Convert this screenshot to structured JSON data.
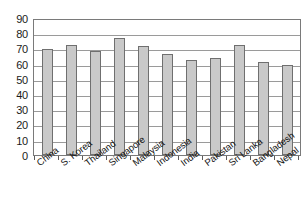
{
  "chart_data": {
    "type": "bar",
    "title": "",
    "subtitle": "",
    "xlabel": "",
    "ylabel": "",
    "categories": [
      "China",
      "S. Korea",
      "Thailand",
      "Singapore",
      "Malaysia",
      "Indonesia",
      "India",
      "Pakistan",
      "Sri Lanka",
      "Bangladesh",
      "Nepal"
    ],
    "values": [
      71,
      73.5,
      69.5,
      78,
      73,
      67.5,
      63.5,
      64.5,
      73.5,
      62,
      60
    ],
    "series": [
      {
        "name": "",
        "values": [
          71,
          73.5,
          69.5,
          78,
          73,
          67.5,
          63.5,
          64.5,
          73.5,
          62,
          60
        ]
      }
    ],
    "ylim": [
      0,
      90
    ],
    "ytick_step": 10,
    "ytick_labels": [
      "90",
      "80",
      "70",
      "60",
      "50",
      "40",
      "30",
      "20",
      "10",
      "0"
    ],
    "ytick_values": [
      90,
      80,
      70,
      60,
      50,
      40,
      30,
      20,
      10,
      0
    ],
    "grid": true,
    "grid_axis": "y",
    "legend": false,
    "legend_position": "none",
    "bar_fill_color": "#c9c9c9",
    "bar_border_color": "#6f6f6f",
    "gridline_color": "#9a9a9a",
    "frame_color": "#7a7a7a",
    "background_color": "#ffffff",
    "text_color": "#111111",
    "xtick_label_rotation": -37
  }
}
